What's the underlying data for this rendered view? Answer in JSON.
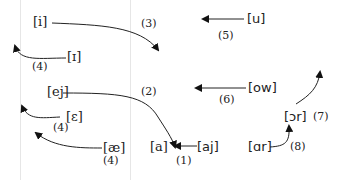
{
  "diagram": {
    "title": "",
    "vowels": {
      "i": "[i]",
      "I": "[ɪ]",
      "ej": "[ej]",
      "E": "[ɛ]",
      "ae": "[æ]",
      "a": "[a]",
      "aj": "[aj]",
      "u": "[u]",
      "ow": "[ow]",
      "or": "[ɔr]",
      "ar": "[ɑr]"
    },
    "steps": {
      "s1": "(1)",
      "s2": "(2)",
      "s3": "(3)",
      "s4a": "(4)",
      "s4b": "(4)",
      "s4c": "(4)",
      "s5": "(5)",
      "s6": "(6)",
      "s7": "(7)",
      "s8": "(8)"
    },
    "edges": [
      {
        "from": "[aj]",
        "to": "[a]",
        "step": "(1)"
      },
      {
        "from": "[ej]",
        "to": "[a]",
        "step": "(2)"
      },
      {
        "from": "[i]",
        "to": "lower region",
        "step": "(3)"
      },
      {
        "from": "[ɪ]",
        "to": "upper-left",
        "step": "(4)"
      },
      {
        "from": "[ɛ]",
        "to": "upper-left",
        "step": "(4)"
      },
      {
        "from": "[æ]",
        "to": "upper-left",
        "step": "(4)"
      },
      {
        "from": "[u]",
        "to": "left",
        "step": "(5)"
      },
      {
        "from": "[ow]",
        "to": "left",
        "step": "(6)"
      },
      {
        "from": "[ɔr]",
        "to": "up",
        "step": "(7)"
      },
      {
        "from": "[ɑr]",
        "to": "[ɔr]",
        "step": "(8)"
      }
    ]
  }
}
